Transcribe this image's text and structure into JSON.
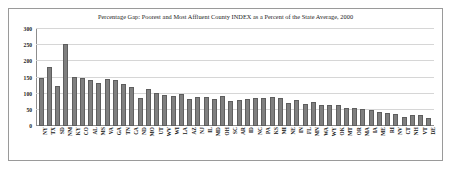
{
  "chart_data": {
    "type": "bar",
    "title": "Percentage Gap: Poorest and Most Affluent County INDEX as a Percent of the State Average, 2000",
    "xlabel": "",
    "ylabel": "",
    "ylim": [
      0,
      300
    ],
    "yticks": [
      0,
      50,
      100,
      150,
      200,
      250,
      300
    ],
    "ytick_labels": [
      "0",
      "50",
      "100",
      "150",
      "200",
      "250",
      "300"
    ],
    "grid": true,
    "legend": "none",
    "bar_color": "#7f7f7f",
    "bar_edge_color": "#5e5e5e",
    "categories": [
      "NY",
      "TX",
      "SD",
      "NM",
      "KY",
      "CO",
      "AL",
      "MS",
      "VA",
      "GA",
      "TN",
      "CA",
      "ND",
      "MO",
      "UT",
      "WV",
      "WI",
      "LA",
      "AZ",
      "NJ",
      "IL",
      "MD",
      "OH",
      "SC",
      "AR",
      "ID",
      "NC",
      "PA",
      "KS",
      "MI",
      "NE",
      "IN",
      "FL",
      "MN",
      "WA",
      "WY",
      "OK",
      "MT",
      "OR",
      "MA",
      "IA",
      "ME",
      "RI",
      "NV",
      "CT",
      "NH",
      "VT",
      "DE"
    ],
    "values": [
      148,
      182,
      125,
      253,
      151,
      150,
      143,
      132,
      146,
      141,
      130,
      121,
      87,
      113,
      103,
      96,
      93,
      99,
      85,
      90,
      90,
      85,
      92,
      76,
      82,
      84,
      86,
      87,
      89,
      87,
      71,
      80,
      69,
      73,
      64,
      64,
      64,
      55,
      55,
      52,
      48,
      44,
      39,
      37,
      28,
      35,
      33,
      25
    ]
  }
}
